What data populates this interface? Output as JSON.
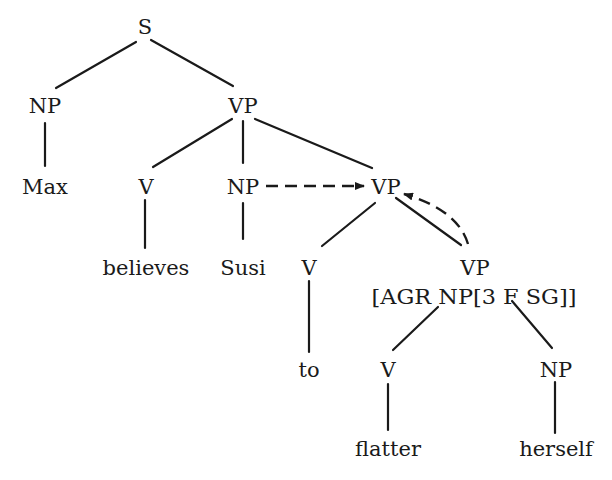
{
  "diagram": {
    "type": "syntax-tree",
    "nodes": {
      "s": "S",
      "np_subj": "NP",
      "vp_main": "VP",
      "max": "Max",
      "v_believes": "V",
      "np_obj": "NP",
      "vp_inf": "VP",
      "believes": "believes",
      "susi": "Susi",
      "v_to": "V",
      "vp_lower": "VP",
      "vp_lower_feature": "[AGR NP[3 F SG]]",
      "to": "to",
      "v_flatter": "V",
      "np_refl": "NP",
      "flatter": "flatter",
      "herself": "herself"
    },
    "edges": [
      [
        "S",
        "NP"
      ],
      [
        "S",
        "VP"
      ],
      [
        "NP",
        "Max"
      ],
      [
        "VP",
        "V"
      ],
      [
        "VP",
        "NP"
      ],
      [
        "VP",
        "VP"
      ],
      [
        "V",
        "believes"
      ],
      [
        "NP",
        "Susi"
      ],
      [
        "VP",
        "V"
      ],
      [
        "VP",
        "VP[AGR NP[3 F SG]]"
      ],
      [
        "V",
        "to"
      ],
      [
        "VP[AGR NP[3 F SG]]",
        "V"
      ],
      [
        "VP[AGR NP[3 F SG]]",
        "NP"
      ],
      [
        "V",
        "flatter"
      ],
      [
        "NP",
        "herself"
      ]
    ],
    "dashed_arrows": [
      {
        "from": "NP (Susi)",
        "to": "VP (infinitival)"
      },
      {
        "from": "VP [AGR NP[3 F SG]]",
        "to": "VP (infinitival)"
      }
    ]
  }
}
